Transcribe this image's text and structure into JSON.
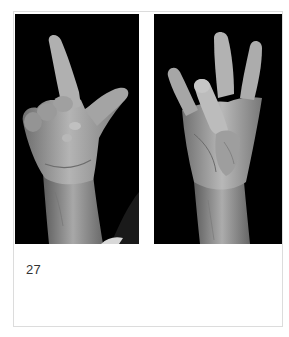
{
  "figure": {
    "caption": "27",
    "photos": [
      {
        "position": "left",
        "subject": "hand gesture: index finger raised, thumb extended, other fingers curled",
        "background_color": "#000000",
        "tone": "grayscale"
      },
      {
        "position": "right",
        "subject": "hand gesture: index, middle and little finger raised, ring finger bent toward palm",
        "background_color": "#000000",
        "tone": "grayscale"
      }
    ],
    "colors": {
      "page_background": "#ffffff",
      "card_border": "#dcdcdc",
      "caption_text": "#333333",
      "photo_background": "#000000"
    }
  }
}
